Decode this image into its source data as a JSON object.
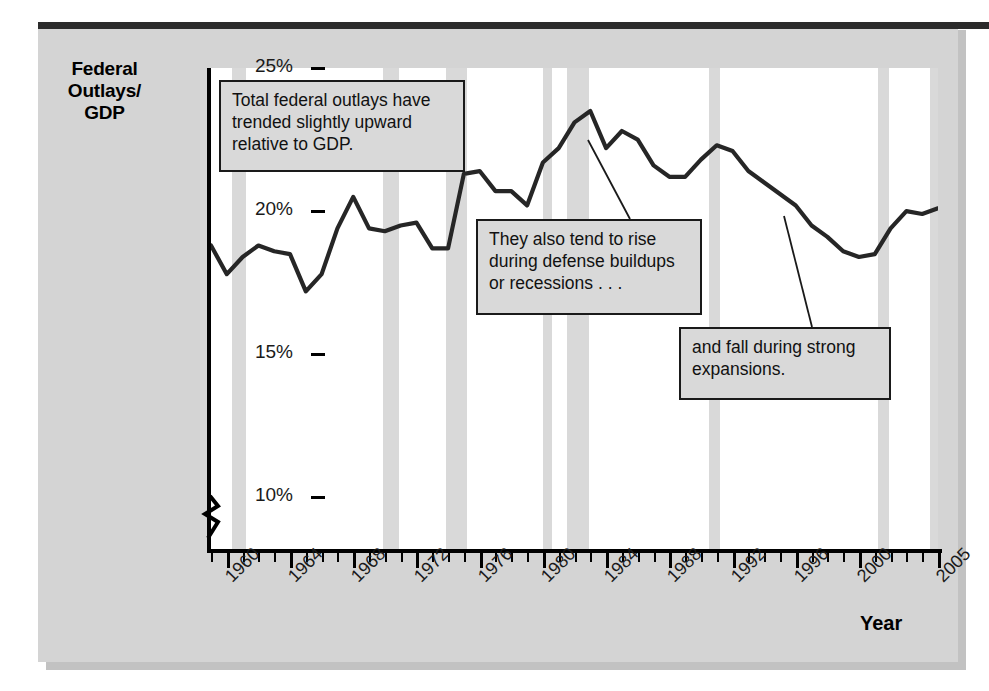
{
  "figure": {
    "y_axis_title": "Federal Outlays/ GDP",
    "y_axis_title_lines": [
      "Federal",
      "Outlays/",
      "GDP"
    ],
    "x_axis_title": "Year",
    "y_tick_labels": [
      "25%",
      "20%",
      "15%",
      "10%"
    ],
    "x_tick_labels": [
      "1960",
      "1964",
      "1968",
      "1972",
      "1976",
      "1980",
      "1984",
      "1988",
      "1992",
      "1996",
      "2000",
      "2005"
    ],
    "annotations": [
      {
        "id": "callout-1",
        "text": "Total federal outlays have trended slightly upward relative to GDP.",
        "lines": [
          "Total federal outlays have",
          "trended slightly upward",
          "relative to GDP."
        ]
      },
      {
        "id": "callout-2",
        "text": "They also tend to rise during defense buildups or recessions . . .",
        "lines": [
          "They also tend to rise",
          "during defense buildups",
          "or recessions . . ."
        ]
      },
      {
        "id": "callout-3",
        "text": "and fall during strong expansions.",
        "lines": [
          "and fall during strong",
          "expansions."
        ]
      }
    ],
    "colors": {
      "page_background": "#ffffff",
      "panel_background": "#d4d4d4",
      "plot_background": "#ffffff",
      "recession_band": "#d9d9d9",
      "line": "#262626",
      "axis": "#000000",
      "callout_fill": "#d9d9d9",
      "callout_border": "#1a1a1a",
      "top_rule": "#2b2b2b"
    }
  },
  "chart_data": {
    "type": "line",
    "title": "",
    "subtitle": "",
    "xlabel": "Year",
    "ylabel": "Federal Outlays/GDP",
    "xlim": [
      1959,
      2005
    ],
    "ylim": [
      8.2,
      25
    ],
    "y_axis_break": true,
    "y_axis_break_below": 10,
    "grid": false,
    "legend": "none",
    "y_ticks": [
      10,
      15,
      20,
      25
    ],
    "y_tick_labels": [
      "10%",
      "15%",
      "20%",
      "25%"
    ],
    "x_ticks": [
      1960,
      1964,
      1968,
      1972,
      1976,
      1980,
      1984,
      1988,
      1992,
      1996,
      2000,
      2005
    ],
    "x_tick_interval_minor": 1,
    "series": [
      {
        "name": "Federal Outlays as percent of GDP",
        "x": [
          1959,
          1960,
          1961,
          1962,
          1963,
          1964,
          1965,
          1966,
          1967,
          1968,
          1969,
          1970,
          1971,
          1972,
          1973,
          1974,
          1975,
          1976,
          1977,
          1978,
          1979,
          1980,
          1981,
          1982,
          1983,
          1984,
          1985,
          1986,
          1987,
          1988,
          1989,
          1990,
          1991,
          1992,
          1993,
          1994,
          1995,
          1996,
          1997,
          1998,
          1999,
          2000,
          2001,
          2002,
          2003,
          2004,
          2005
        ],
        "values": [
          18.8,
          17.8,
          18.4,
          18.8,
          18.6,
          18.5,
          17.2,
          17.8,
          19.4,
          20.5,
          19.4,
          19.3,
          19.5,
          19.6,
          18.7,
          18.7,
          21.3,
          21.4,
          20.7,
          20.7,
          20.2,
          21.7,
          22.2,
          23.1,
          23.5,
          22.2,
          22.8,
          22.5,
          21.6,
          21.2,
          21.2,
          21.8,
          22.3,
          22.1,
          21.4,
          21.0,
          20.6,
          20.2,
          19.5,
          19.1,
          18.6,
          18.4,
          18.5,
          19.4,
          20.0,
          19.9,
          20.1
        ]
      }
    ],
    "recession_bands": [
      {
        "start": 1960.3,
        "end": 1961.2
      },
      {
        "start": 1969.9,
        "end": 1970.9
      },
      {
        "start": 1973.9,
        "end": 1975.2
      },
      {
        "start": 1980.0,
        "end": 1980.6
      },
      {
        "start": 1981.5,
        "end": 1982.9
      },
      {
        "start": 1990.5,
        "end": 1991.2
      },
      {
        "start": 2001.2,
        "end": 2001.9
      },
      {
        "start": 2004.5,
        "end": 2005.0
      }
    ],
    "annotations": [
      {
        "text": "Total federal outlays have trended slightly upward relative to GDP.",
        "points_to": null
      },
      {
        "text": "They also tend to rise during defense buildups or recessions . . .",
        "points_to": {
          "x": 1982,
          "y": 23.1
        }
      },
      {
        "text": "and fall during strong expansions.",
        "points_to": {
          "x": 1997.5,
          "y": 19.5
        }
      }
    ]
  }
}
